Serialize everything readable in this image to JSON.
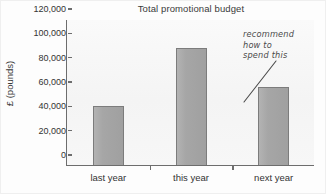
{
  "chart_data": {
    "type": "bar",
    "title": "Total promotional budget",
    "xlabel": "",
    "ylabel": "£ (pounds)",
    "categories": [
      "last year",
      "this year",
      "next year"
    ],
    "values": [
      48500,
      96000,
      64000
    ],
    "ylim": [
      0,
      120000
    ],
    "yticks": [
      0,
      20000,
      40000,
      60000,
      80000,
      100000,
      120000
    ],
    "ytick_labels": [
      "0",
      "20,000",
      "40,000",
      "60,000",
      "80,000",
      "100,000",
      "120,000"
    ],
    "grid": false,
    "legend": null,
    "bar_color": "#a6a6a6",
    "bar_edge_color": "#7c7c7c",
    "axis_color": "#6d6d6d",
    "plot_background": "#f5f5f5",
    "annotations": [
      {
        "name": "recommendation-note",
        "lines": [
          "recommend",
          "how to",
          "spend this"
        ],
        "points_to_category": "next year",
        "style": "handwritten"
      }
    ]
  }
}
